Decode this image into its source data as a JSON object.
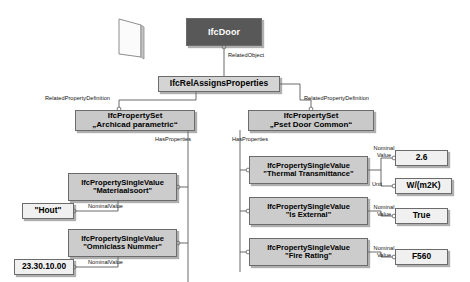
{
  "diagram": {
    "colors": {
      "entity_fill": "#585858",
      "entity_text": "#ffffff",
      "relationship_fill": "#d4d4d4",
      "propertyset_fill": "#c9c9c9",
      "property_fill": "#cccccc",
      "value_fill": "#f0f0f0",
      "line": "#555555",
      "background": "#ffffff"
    },
    "symbols": {
      "door_symbol": "door-parallelogram-icon"
    },
    "nodes": {
      "door": {
        "label": "IfcDoor"
      },
      "rel_assigns": {
        "label": "IfcRelAssignsProperties"
      },
      "pset_archicad": {
        "line1": "IfcPropertySet",
        "line2": "„Archicad parametric“"
      },
      "pset_door_common": {
        "line1": "IfcPropertySet",
        "line2": "„Pset Door Common“"
      },
      "prop_materiaalsoort": {
        "line1": "IfcPropertySingleValue",
        "line2": "\"Materiaalsoort\""
      },
      "prop_omniclass": {
        "line1": "IfcPropertySingleValue",
        "line2": "\"Omniclass Nummer\""
      },
      "prop_thermal": {
        "line1": "IfcPropertySingleValue",
        "line2": "\"Thermal Transmittance\""
      },
      "prop_external": {
        "line1": "IfcPropertySingleValue",
        "line2": "\"Is External\""
      },
      "prop_fire": {
        "line1": "IfcPropertySingleValue",
        "line2": "\"Fire Rating\""
      },
      "val_hout": {
        "label": "\"Hout\""
      },
      "val_omniclass": {
        "label": "23.30.10.00"
      },
      "val_thermal": {
        "label": "2.6"
      },
      "val_thermal_unit": {
        "label": "W/(m2K)"
      },
      "val_external": {
        "label": "True"
      },
      "val_fire": {
        "label": "F560"
      }
    },
    "edge_labels": {
      "related_object": "RelatedObject",
      "related_property_definition_left": "RelatedPropertyDefinition",
      "related_property_definition_right": "RelatedPropertyDefinition",
      "has_properties_left": "HasProperties",
      "has_properties_right": "HasProperties",
      "nominal_value_hout": "NominalValue",
      "nominal_value_omniclass": "NominalValue",
      "nominal_value_thermal_l1": "Nominal",
      "nominal_value_thermal_l2": "Value",
      "unit_thermal": "Unit",
      "nominal_value_external_l1": "Nominal",
      "nominal_value_external_l2": "Value",
      "nominal_value_fire_l1": "Nominal",
      "nominal_value_fire_l2": "Value"
    }
  }
}
